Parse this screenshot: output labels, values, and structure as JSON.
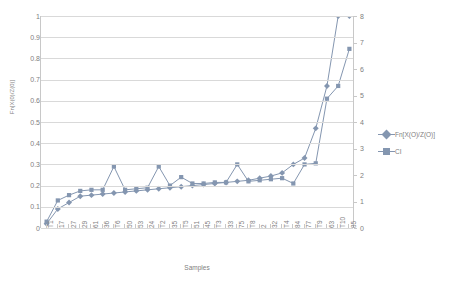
{
  "chart_data": {
    "type": "line",
    "title": "",
    "xlabel": "Samples",
    "ylabel": "Fn[X(0)/Z(0)]",
    "ylabel_right": "",
    "ylim": [
      0,
      1
    ],
    "ylim_right": [
      0,
      8
    ],
    "yticks": [
      "0",
      "0.1",
      "0.2",
      "0.3",
      "0.4",
      "0.5",
      "0.6",
      "0.7",
      "0.8",
      "0.9",
      "1"
    ],
    "yticks_right": [
      "0",
      "1",
      "2",
      "3",
      "4",
      "5",
      "6",
      "7",
      "8"
    ],
    "grid": true,
    "legend_position": "right",
    "categories": [
      "T1",
      "17",
      "27",
      "29",
      "61",
      "36",
      "T6",
      "50",
      "53",
      "24",
      "T2",
      "35",
      "T5",
      "51",
      "45",
      "T3",
      "33",
      "75",
      "T8",
      "2",
      "32",
      "T4",
      "84",
      "77",
      "T9",
      "63",
      "T10",
      "85"
    ],
    "series": [
      {
        "name": "Fn[X(O)/Z(O)]",
        "marker": "diamond",
        "color": "#8496b0",
        "axis": "left",
        "values": [
          0.02,
          0.09,
          0.12,
          0.15,
          0.155,
          0.16,
          0.165,
          0.17,
          0.175,
          0.18,
          0.185,
          0.19,
          0.195,
          0.2,
          0.205,
          0.21,
          0.215,
          0.22,
          0.225,
          0.235,
          0.245,
          0.26,
          0.3,
          0.33,
          0.47,
          0.67,
          1.0,
          1.0
        ]
      },
      {
        "name": "CI",
        "marker": "square",
        "color": "#8496b0",
        "axis": "left",
        "values": [
          0.03,
          0.13,
          0.155,
          0.175,
          0.18,
          0.18,
          0.29,
          0.18,
          0.185,
          0.19,
          0.29,
          0.2,
          0.24,
          0.21,
          0.21,
          0.215,
          0.215,
          0.3,
          0.22,
          0.225,
          0.23,
          0.235,
          0.21,
          0.3,
          0.305,
          0.61,
          0.67,
          0.845
        ]
      }
    ],
    "legend": [
      {
        "label": "Fn[X(O)/Z(O)]",
        "marker": "diamond",
        "color": "#8496b0"
      },
      {
        "label": "CI",
        "marker": "square",
        "color": "#8496b0"
      }
    ],
    "colors": {
      "series": "#8496b0",
      "grid": "#d9d9d9",
      "axis": "#c8c8c8",
      "text": "#808080",
      "background": "#ffffff"
    }
  }
}
